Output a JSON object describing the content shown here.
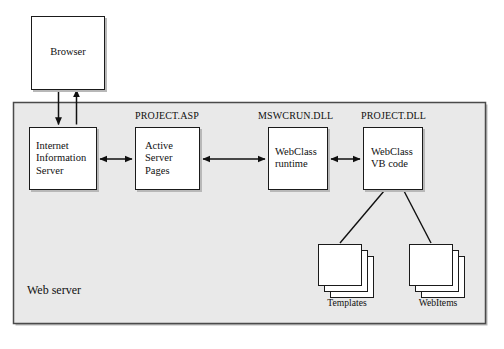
{
  "diagram": {
    "title": "Web server",
    "panel": {
      "label": "Web server",
      "fill": "#e9e9e9",
      "border": "#4a4a4a"
    },
    "nodes": [
      {
        "id": "browser",
        "label": "Browser",
        "caption": "",
        "align": "center",
        "x": 31,
        "y": 16,
        "w": 74,
        "h": 74
      },
      {
        "id": "iis",
        "label": "Internet\nInformation\nServer",
        "caption": "",
        "align": "left",
        "x": 29,
        "y": 127,
        "w": 68,
        "h": 63
      },
      {
        "id": "asp",
        "label": "Active\nServer\nPages",
        "caption": "PROJECT.ASP",
        "align": "left",
        "x": 135,
        "y": 127,
        "w": 65,
        "h": 63
      },
      {
        "id": "webclass-runtime",
        "label": "WebClass\nruntime",
        "caption": "MSWCRUN.DLL",
        "align": "left",
        "x": 268,
        "y": 127,
        "w": 60,
        "h": 63
      },
      {
        "id": "webclass-vb",
        "label": "WebClass\nVB code",
        "caption": "PROJECT.DLL",
        "align": "left",
        "x": 363,
        "y": 127,
        "w": 60,
        "h": 63
      }
    ],
    "stacks": [
      {
        "id": "templates",
        "label": "Templates",
        "x": 318,
        "y": 244,
        "w": 44,
        "h": 42
      },
      {
        "id": "webitems",
        "label": "WebItems",
        "x": 409,
        "y": 244,
        "w": 44,
        "h": 42
      }
    ],
    "connections": [
      {
        "id": "browser-to-iis",
        "from": "browser",
        "to": "iis",
        "direction": "down"
      },
      {
        "id": "iis-to-browser",
        "from": "iis",
        "to": "browser",
        "direction": "up"
      },
      {
        "id": "iis-asp",
        "from": "iis",
        "to": "asp",
        "direction": "both"
      },
      {
        "id": "asp-runtime",
        "from": "asp",
        "to": "webclass-runtime",
        "direction": "both"
      },
      {
        "id": "runtime-vb",
        "from": "webclass-runtime",
        "to": "webclass-vb",
        "direction": "both"
      },
      {
        "id": "vb-templates",
        "from": "webclass-vb",
        "to": "templates",
        "direction": "none"
      },
      {
        "id": "vb-webitems",
        "from": "webclass-vb",
        "to": "webitems",
        "direction": "none"
      }
    ]
  }
}
